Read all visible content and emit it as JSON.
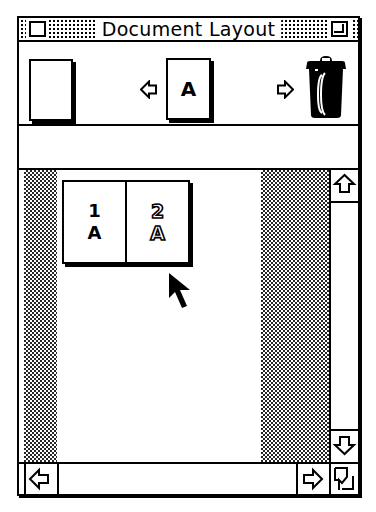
{
  "window": {
    "title": "Document Layout",
    "close_box": "close-box",
    "zoom_box": "zoom-box"
  },
  "toolbar": {
    "items": [
      {
        "name": "blank-page-tool",
        "icon": "blank-page-icon",
        "label": ""
      },
      {
        "name": "previous-master-arrow",
        "icon": "left-arrow-icon"
      },
      {
        "name": "master-page-a",
        "icon": "master-page-icon",
        "label": "A"
      },
      {
        "name": "next-master-arrow",
        "icon": "right-arrow-icon"
      },
      {
        "name": "trash-can",
        "icon": "trash-icon"
      }
    ]
  },
  "info_strip": {
    "text": ""
  },
  "layout": {
    "spreads": [
      {
        "pages": [
          {
            "number": "1",
            "master": "A",
            "selected": false
          },
          {
            "number": "2",
            "master": "A",
            "selected": true
          }
        ]
      }
    ],
    "pasteboard_colors": {
      "shade": "#000000",
      "page": "#ffffff"
    }
  },
  "scrollbars": {
    "vertical": {
      "up": "up-arrow",
      "down": "down-arrow",
      "thumb_visible": false
    },
    "horizontal": {
      "left": "left-arrow",
      "right": "right-arrow",
      "thumb_visible": false
    }
  },
  "cursor": {
    "type": "arrow-pointer"
  }
}
